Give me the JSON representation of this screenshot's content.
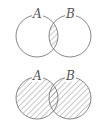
{
  "diagrams": [
    {
      "name": "intersection",
      "description": "A ∩ B shaded",
      "labels": {
        "a": "A",
        "b": "B"
      },
      "shaded_region": "intersection"
    },
    {
      "name": "union",
      "description": "A ∪ B shaded",
      "labels": {
        "a": "A",
        "b": "B"
      },
      "shaded_region": "union"
    }
  ],
  "colors": {
    "stroke": "#7a7a7a",
    "hatch": "#9a9a9a",
    "label": "#555555",
    "background": "#ffffff"
  }
}
